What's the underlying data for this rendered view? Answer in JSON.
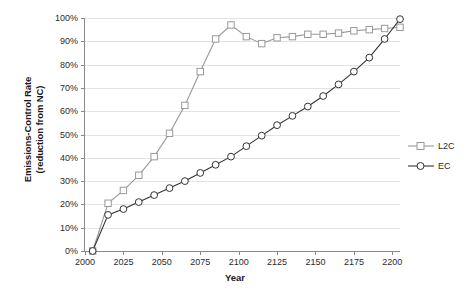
{
  "chart_data": {
    "type": "line",
    "title": "",
    "xlabel": "Year",
    "ylabel": "Emissions-Control Rate (reduction from NC)",
    "ylabel_line1": "Emissions-Control Rate",
    "ylabel_line2": "(reduction from NC)",
    "xlim": [
      2000,
      2205
    ],
    "ylim": [
      0,
      100
    ],
    "grid": true,
    "legend_position": "right",
    "x_tick_labels": [
      "2000",
      "2025",
      "2050",
      "2075",
      "2100",
      "2125",
      "2150",
      "2175",
      "2200"
    ],
    "x_ticks": [
      2000,
      2025,
      2050,
      2075,
      2100,
      2125,
      2150,
      2175,
      2200
    ],
    "y_tick_labels": [
      "0%",
      "10%",
      "20%",
      "30%",
      "40%",
      "50%",
      "60%",
      "70%",
      "80%",
      "90%",
      "100%"
    ],
    "y_ticks": [
      0,
      10,
      20,
      30,
      40,
      50,
      60,
      70,
      80,
      90,
      100
    ],
    "x": [
      2005,
      2015,
      2025,
      2035,
      2045,
      2055,
      2065,
      2075,
      2085,
      2095,
      2105,
      2115,
      2125,
      2135,
      2145,
      2155,
      2165,
      2175,
      2185,
      2195,
      2205
    ],
    "series": [
      {
        "name": "L2C",
        "color": "#999999",
        "marker": "square",
        "values": [
          0,
          20.5,
          26,
          32.5,
          40.5,
          50.5,
          62.5,
          77,
          91,
          97,
          92,
          89,
          91.5,
          92,
          93,
          93,
          93.5,
          94.5,
          95,
          95.5,
          96
        ]
      },
      {
        "name": "EC",
        "color": "#333333",
        "marker": "circle",
        "values": [
          0,
          15.5,
          18,
          21,
          24,
          27,
          30,
          33.5,
          37,
          40.5,
          45,
          49.5,
          54,
          58,
          62,
          66.5,
          71.5,
          77,
          83,
          91,
          99.5
        ]
      }
    ]
  },
  "legend": {
    "items": [
      {
        "label": "L2C"
      },
      {
        "label": "EC"
      }
    ]
  }
}
